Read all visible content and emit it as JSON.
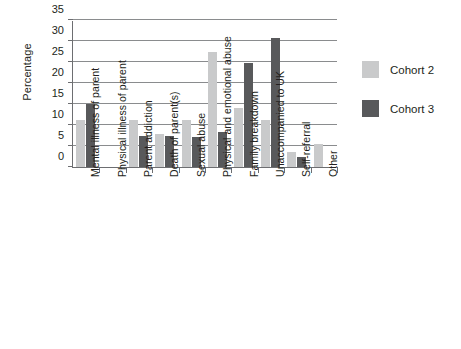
{
  "chart_data": {
    "type": "bar",
    "title": "",
    "subtitle": "",
    "xlabel": "",
    "ylabel": "Percentage",
    "ylim": [
      0,
      35
    ],
    "ytick_step": 5,
    "yticks": [
      0,
      5,
      10,
      15,
      20,
      25,
      30,
      35
    ],
    "grid": true,
    "grid_axis": "y",
    "legend_position": "right",
    "categories": [
      "Mental illness of parent",
      "Physical illness of parent",
      "Parent addiction",
      "Death of parent(s)",
      "Sexual abuse",
      "Physical and emotional abuse",
      "Family breakdown",
      "Unaccompanied to UK",
      "Self-referral",
      "Other"
    ],
    "series": [
      {
        "name": "Cohort 2",
        "color": "#c9cacb",
        "values": [
          11.1,
          0,
          11.1,
          7.9,
          11.1,
          27.3,
          14.0,
          11.1,
          3.5,
          5.5
        ]
      },
      {
        "name": "Cohort 3",
        "color": "#58595b",
        "values": [
          15.0,
          0,
          7.5,
          7.3,
          7.2,
          8.3,
          24.8,
          30.8,
          2.5,
          0
        ]
      }
    ]
  },
  "legend": {
    "entries": [
      {
        "label": "Cohort 2",
        "color": "#c9cacb"
      },
      {
        "label": "Cohort 3",
        "color": "#58595b"
      }
    ]
  },
  "axis": {
    "y_title": "Percentage"
  },
  "colors": {
    "cohort2": "#c9cacb",
    "cohort3": "#58595b",
    "axis": "#6d6e71",
    "grid": "#8a8c8e",
    "text": "#231f20",
    "background": "#ffffff"
  }
}
